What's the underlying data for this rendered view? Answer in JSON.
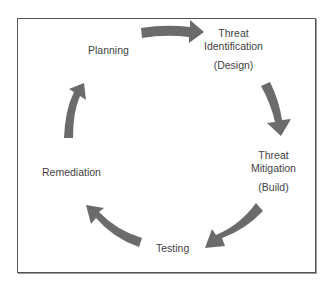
{
  "diagram": {
    "type": "cycle",
    "colors": {
      "arrow": "#6b6b6b",
      "text": "#3f3f3f",
      "border": "#555555"
    },
    "stages": [
      {
        "id": "planning",
        "lines": [
          "Planning"
        ]
      },
      {
        "id": "threat-identification",
        "lines": [
          "Threat",
          "Identification"
        ],
        "sub": "(Design)"
      },
      {
        "id": "threat-mitigation",
        "lines": [
          "Threat",
          "Mitigation"
        ],
        "sub": "(Build)"
      },
      {
        "id": "testing",
        "lines": [
          "Testing"
        ]
      },
      {
        "id": "remediation",
        "lines": [
          "Remediation"
        ]
      }
    ],
    "arrows": [
      {
        "from": "planning",
        "to": "threat-identification"
      },
      {
        "from": "threat-identification",
        "to": "threat-mitigation"
      },
      {
        "from": "threat-mitigation",
        "to": "testing"
      },
      {
        "from": "testing",
        "to": "remediation"
      },
      {
        "from": "remediation",
        "to": "planning"
      }
    ]
  }
}
